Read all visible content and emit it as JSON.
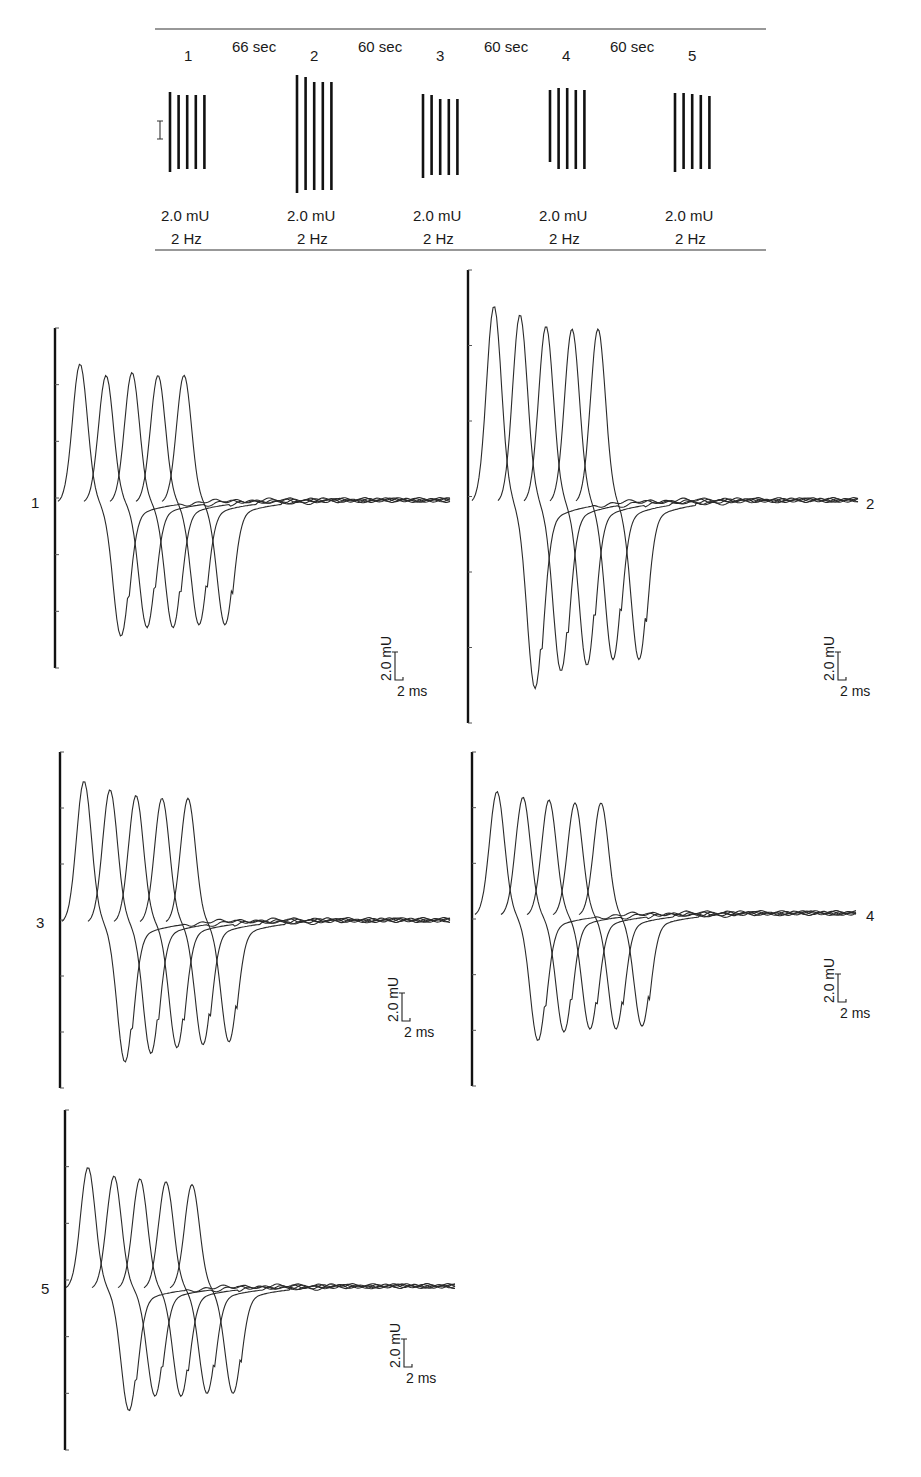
{
  "chart_data": {
    "type": "line",
    "xlabel": "time",
    "ylabel": "amplitude",
    "scale_bar": {
      "amplitude_label": "2.0 mU",
      "time_label": "2 ms"
    },
    "axis": {
      "grid": false,
      "ticks_per_axis": 7
    },
    "summary_strip": {
      "train_labels": [
        "1",
        "2",
        "3",
        "4",
        "5"
      ],
      "intervals": [
        "66 sec",
        "60 sec",
        "60 sec",
        "60 sec"
      ],
      "stim_intensity": [
        "2.0 mU",
        "2.0 mU",
        "2.0 mU",
        "2.0 mU",
        "2.0 mU"
      ],
      "stim_rate": [
        "2 Hz",
        "2 Hz",
        "2 Hz",
        "2 Hz",
        "2 Hz"
      ],
      "bar_heights_px": [
        [
          80,
          74,
          74,
          74,
          74
        ],
        [
          118,
          113,
          108,
          108,
          108
        ],
        [
          84,
          80,
          76,
          76,
          76
        ],
        [
          72,
          81,
          81,
          79,
          79
        ],
        [
          79,
          76,
          75,
          74,
          73
        ]
      ]
    },
    "panels": [
      {
        "label": "1",
        "label_side": "left",
        "series": [
          {
            "name": "response 1",
            "peak": 4.8,
            "trough": -4.6
          },
          {
            "name": "response 2",
            "peak": 4.4,
            "trough": -4.3
          },
          {
            "name": "response 3",
            "peak": 4.5,
            "trough": -4.3
          },
          {
            "name": "response 4",
            "peak": 4.4,
            "trough": -4.2
          },
          {
            "name": "response 5",
            "peak": 4.4,
            "trough": -4.2
          }
        ]
      },
      {
        "label": "2",
        "label_side": "right",
        "series": [
          {
            "name": "response 1",
            "peak": 6.8,
            "trough": -6.4
          },
          {
            "name": "response 2",
            "peak": 6.5,
            "trough": -5.8
          },
          {
            "name": "response 3",
            "peak": 6.1,
            "trough": -5.6
          },
          {
            "name": "response 4",
            "peak": 6.0,
            "trough": -5.4
          },
          {
            "name": "response 5",
            "peak": 6.0,
            "trough": -5.4
          }
        ]
      },
      {
        "label": "3",
        "label_side": "left",
        "series": [
          {
            "name": "response 1",
            "peak": 4.9,
            "trough": -4.8
          },
          {
            "name": "response 2",
            "peak": 4.6,
            "trough": -4.5
          },
          {
            "name": "response 3",
            "peak": 4.4,
            "trough": -4.3
          },
          {
            "name": "response 4",
            "peak": 4.3,
            "trough": -4.2
          },
          {
            "name": "response 5",
            "peak": 4.3,
            "trough": -4.1
          }
        ]
      },
      {
        "label": "4",
        "label_side": "right",
        "series": [
          {
            "name": "response 1",
            "peak": 4.3,
            "trough": -4.3
          },
          {
            "name": "response 2",
            "peak": 4.1,
            "trough": -4.0
          },
          {
            "name": "response 3",
            "peak": 4.0,
            "trough": -3.9
          },
          {
            "name": "response 4",
            "peak": 3.9,
            "trough": -3.9
          },
          {
            "name": "response 5",
            "peak": 3.9,
            "trough": -3.8
          }
        ]
      },
      {
        "label": "5",
        "label_side": "left",
        "series": [
          {
            "name": "response 1",
            "peak": 4.2,
            "trough": -4.2
          },
          {
            "name": "response 2",
            "peak": 3.9,
            "trough": -3.7
          },
          {
            "name": "response 3",
            "peak": 3.8,
            "trough": -3.7
          },
          {
            "name": "response 4",
            "peak": 3.7,
            "trough": -3.6
          },
          {
            "name": "response 5",
            "peak": 3.6,
            "trough": -3.6
          }
        ]
      }
    ]
  }
}
